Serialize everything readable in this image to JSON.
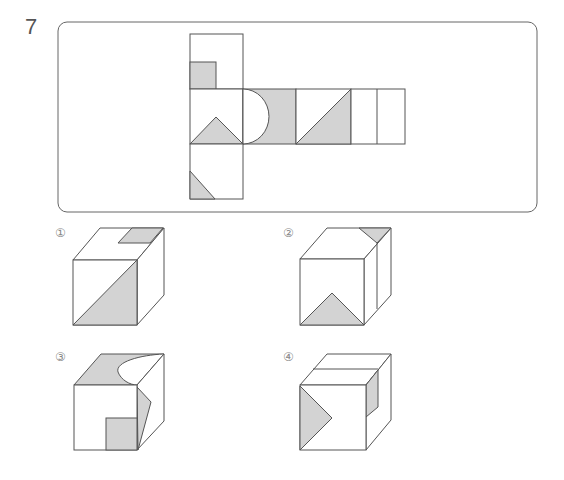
{
  "question": {
    "number": "7"
  },
  "net": {
    "description": "Cube net with shaded patterns",
    "faces": [
      {
        "id": "top",
        "pattern": "small square at bottom-left"
      },
      {
        "id": "left-middle",
        "pattern": "triangle at bottom"
      },
      {
        "id": "center",
        "pattern": "shaded with semicircle cutout on left"
      },
      {
        "id": "right1",
        "pattern": "diagonal triangle bottom-right"
      },
      {
        "id": "right2",
        "pattern": "vertical split line"
      },
      {
        "id": "bottom",
        "pattern": "triangle at bottom-left corner"
      }
    ]
  },
  "options": [
    {
      "label": "①"
    },
    {
      "label": "②"
    },
    {
      "label": "③"
    },
    {
      "label": "④"
    }
  ],
  "colors": {
    "shade": "#d3d3d3",
    "stroke": "#555555",
    "border": "#777777"
  }
}
